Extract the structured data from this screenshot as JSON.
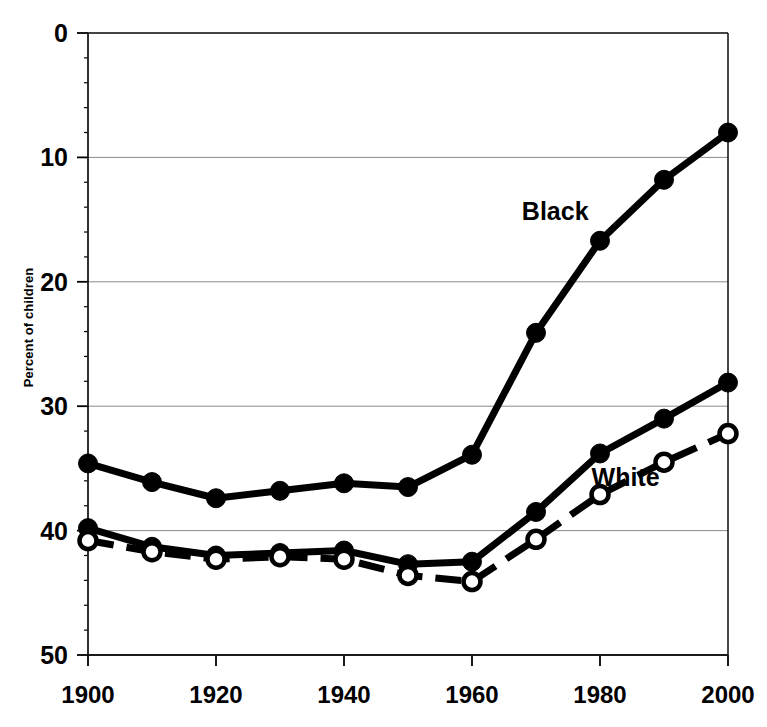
{
  "chart_data": {
    "type": "line",
    "title": "",
    "xlabel": "",
    "ylabel": "Percent of children",
    "xlim": [
      1900,
      2000
    ],
    "ylim": [
      0,
      50
    ],
    "xticks": [
      1900,
      1920,
      1940,
      1960,
      1980,
      2000
    ],
    "yticks": [
      0,
      10,
      20,
      30,
      40,
      50
    ],
    "grid": true,
    "grid_axis": "y",
    "legend": "inline-annotations",
    "x": [
      1900,
      1910,
      1920,
      1930,
      1940,
      1950,
      1960,
      1970,
      1980,
      1990,
      2000
    ],
    "series": [
      {
        "name": "Black",
        "marker": "filled-circle",
        "linestyle": "solid",
        "color": "#000000",
        "values": [
          15.4,
          13.9,
          12.6,
          13.2,
          13.8,
          13.5,
          16.1,
          25.9,
          33.3,
          38.2,
          42.0
        ]
      },
      {
        "name": "White",
        "marker": "filled-circle",
        "linestyle": "solid",
        "color": "#000000",
        "values": [
          10.2,
          8.7,
          8.0,
          8.2,
          8.4,
          7.3,
          7.5,
          11.5,
          16.2,
          19.0,
          21.9
        ]
      },
      {
        "name": "Dashed",
        "marker": "open-circle",
        "linestyle": "dashed",
        "color": "#000000",
        "values": [
          9.2,
          8.3,
          7.7,
          7.9,
          7.7,
          6.4,
          5.9,
          9.3,
          12.9,
          15.5,
          17.8
        ]
      }
    ],
    "annotations": [
      {
        "text": "Black",
        "x": 1973,
        "y": 35.0
      },
      {
        "text": "White",
        "x": 1984,
        "y": 13.6
      }
    ]
  },
  "axis": {
    "y_tick_labels": [
      "50",
      "40",
      "30",
      "20",
      "10",
      "0"
    ],
    "x_tick_labels": [
      "1900",
      "1920",
      "1940",
      "1960",
      "1980",
      "2000"
    ],
    "y_axis_title": "Percent of children"
  }
}
